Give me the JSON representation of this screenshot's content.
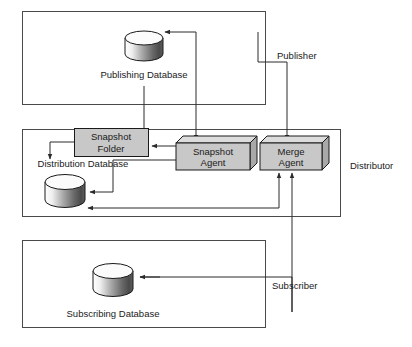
{
  "diagram": {
    "type": "replication-topology",
    "zones": [
      {
        "id": "publisher",
        "label": "Publisher",
        "x": 22,
        "y": 11,
        "w": 243,
        "h": 93
      },
      {
        "id": "distributor",
        "label": "Distributor",
        "x": 22,
        "y": 129,
        "w": 318,
        "h": 87
      },
      {
        "id": "subscriber",
        "label": "Subscriber",
        "x": 22,
        "y": 240,
        "w": 243,
        "h": 87
      }
    ],
    "zone_labels": [
      {
        "id": "publisher-zone-label",
        "text": "Publisher",
        "x": 277,
        "y": 59
      },
      {
        "id": "distributor-zone-label",
        "text": "Distributor",
        "x": 350,
        "y": 169
      },
      {
        "id": "subscriber-zone-label",
        "text": "Subscriber",
        "x": 272,
        "y": 289
      }
    ],
    "databases": [
      {
        "id": "publishing-database",
        "label": "Publishing Database",
        "cx": 144,
        "cy": 45,
        "rx": 19,
        "ry": 7,
        "height": 23,
        "label_x": 144,
        "label_y": 78
      },
      {
        "id": "distribution-database",
        "label": "Distribution Database",
        "cx": 65,
        "cy": 187,
        "rx": 20,
        "ry": 7.5,
        "height": 24,
        "label_x": 83,
        "label_y": 167
      },
      {
        "id": "subscribing-database",
        "label": "Subscribing Database",
        "cx": 113,
        "cy": 278,
        "rx": 20,
        "ry": 7.5,
        "height": 24,
        "label_x": 113,
        "label_y": 317
      }
    ],
    "flat_boxes": [
      {
        "id": "snapshot-folder-box",
        "line1": "Snapshot",
        "line2": "Folder",
        "x": 74,
        "y": 128,
        "w": 74,
        "h": 28
      }
    ],
    "agents": [
      {
        "id": "snapshot-agent",
        "line1": "Snapshot",
        "line2": "Agent",
        "x": 176,
        "y": 143,
        "w": 74,
        "h": 27,
        "depth": 7
      },
      {
        "id": "merge-agent",
        "line1": "Merge",
        "line2": "Agent",
        "x": 260,
        "y": 143,
        "w": 62,
        "h": 27,
        "depth": 7
      }
    ],
    "connectors": [
      {
        "id": "publisher-to-snapshot-agent",
        "path": "M 196 137 L 196 32 L 168 32",
        "arrow": "left"
      },
      {
        "id": "publishing-db-to-snapshot-agent",
        "path": "M 144 85 L 144 137",
        "arrow": "down"
      },
      {
        "id": "publisher-to-merge-agent",
        "path": "M 287 137 L 287 62 L 258 62",
        "arrow": "left"
      },
      {
        "id": "snapshot-agent-to-folder",
        "path": "M 176 150 L 152 150",
        "arrow": "left"
      },
      {
        "id": "folder-to-distribution-db",
        "path": "M 74 143 L 50 143 L 50 160",
        "arrow": "down"
      },
      {
        "id": "snapshot-agent-to-distribution-db",
        "path": "M 176 162 L 113 162 L 113 192 L 91 192",
        "arrow": "left"
      },
      {
        "id": "merge-agent-to-distribution-db",
        "path": "M 278 176 L 278 209 L 91 209",
        "arrow": "left-up"
      },
      {
        "id": "subscriber-to-merge-agent",
        "path": "M 292 176 L 292 305 L 266 305",
        "arrow": "up"
      },
      {
        "id": "merge-agent-to-subscriber-db",
        "path": "M 292 305 L 292 277 L 141 277",
        "arrow": "left"
      }
    ],
    "colors": {
      "zone_stroke": "#4a4a4a",
      "connector_stroke": "#2b2b2b",
      "box_fill": "#c8c8c8",
      "box_top_fill": "#dcdcdc",
      "box_side_fill": "#a8a8a8",
      "text": "#1a1a1a",
      "background": "#ffffff"
    }
  }
}
